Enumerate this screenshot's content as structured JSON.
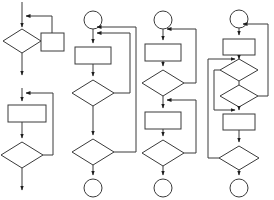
{
  "document": {
    "title": "Flowchart Diagram Sheet",
    "kind": "flowchart",
    "background_color": "#ffffff",
    "stroke_color": "#3a3a3a",
    "arrow_color": "#1d1d1d",
    "fill_color": "#ffffff",
    "width": 274,
    "height": 200,
    "description": "Four vertical control-flow flowchart columns drawn with rectangles (process), diamonds (decision), circles (terminator) and directed connector arrows with feedback loops."
  },
  "columns": [
    {
      "id": "column-1",
      "name": "flow-column-1",
      "label": "Column 1",
      "start_terminator": "none",
      "end_terminator": "arrow",
      "nodes": [
        {
          "id": "c1-d1",
          "type": "decision",
          "shape": "diamond",
          "label": "",
          "cx": 22,
          "cy": 41,
          "rx": 19,
          "ry": 12
        },
        {
          "id": "c1-p1",
          "type": "process",
          "shape": "rectangle",
          "label": "",
          "x": 41,
          "y": 33,
          "w": 23,
          "h": 18
        },
        {
          "id": "c1-p2",
          "type": "process",
          "shape": "rectangle",
          "label": "",
          "x": 8,
          "y": 105,
          "w": 38,
          "h": 17
        },
        {
          "id": "c1-d2",
          "type": "decision",
          "shape": "diamond",
          "label": "",
          "cx": 22,
          "cy": 155,
          "rx": 21,
          "ry": 13
        }
      ],
      "edges": [
        {
          "id": "c1-e1",
          "from": "top-entry",
          "to": "c1-d1",
          "kind": "straight"
        },
        {
          "id": "c1-e2",
          "from": "c1-d1",
          "to": "c1-p1",
          "kind": "straight"
        },
        {
          "id": "c1-e3",
          "from": "c1-p1",
          "to": "top-entry",
          "kind": "feedback-loop"
        },
        {
          "id": "c1-e4",
          "from": "c1-d1",
          "to": "exit-1",
          "kind": "straight"
        },
        {
          "id": "c1-e5",
          "from": "segment-entry-2",
          "to": "c1-p2",
          "kind": "straight"
        },
        {
          "id": "c1-e6",
          "from": "c1-p2",
          "to": "c1-d2",
          "kind": "straight"
        },
        {
          "id": "c1-e7",
          "from": "c1-d2",
          "to": "segment-entry-2",
          "kind": "feedback-loop"
        },
        {
          "id": "c1-e8",
          "from": "c1-d2",
          "to": "exit-2",
          "kind": "straight"
        }
      ]
    },
    {
      "id": "column-2",
      "name": "flow-column-2",
      "label": "Column 2",
      "start_terminator": "circle",
      "end_terminator": "circle",
      "nodes": [
        {
          "id": "c2-t1",
          "type": "terminator",
          "shape": "circle",
          "label": "",
          "cx": 93,
          "cy": 20,
          "r": 9
        },
        {
          "id": "c2-p1",
          "type": "process",
          "shape": "rectangle",
          "label": "",
          "x": 75,
          "y": 47,
          "w": 36,
          "h": 17
        },
        {
          "id": "c2-d1",
          "type": "decision",
          "shape": "diamond",
          "label": "",
          "cx": 93,
          "cy": 93,
          "rx": 21,
          "ry": 13
        },
        {
          "id": "c2-d2",
          "type": "decision",
          "shape": "diamond",
          "label": "",
          "cx": 93,
          "cy": 152,
          "rx": 21,
          "ry": 13
        },
        {
          "id": "c2-t2",
          "type": "terminator",
          "shape": "circle",
          "label": "",
          "cx": 93,
          "cy": 188,
          "r": 9
        }
      ],
      "edges": [
        {
          "id": "c2-e1",
          "from": "c2-t1",
          "to": "c2-p1",
          "kind": "straight"
        },
        {
          "id": "c2-e2",
          "from": "c2-p1",
          "to": "c2-d1",
          "kind": "straight"
        },
        {
          "id": "c2-e3",
          "from": "c2-d1",
          "to": "c2-p1-entry",
          "kind": "feedback-loop-inner"
        },
        {
          "id": "c2-e4",
          "from": "c2-d1",
          "to": "c2-d2",
          "kind": "straight"
        },
        {
          "id": "c2-e5",
          "from": "c2-d2",
          "to": "c2-t1-exit",
          "kind": "feedback-loop-outer"
        },
        {
          "id": "c2-e6",
          "from": "c2-d2",
          "to": "c2-t2",
          "kind": "straight"
        }
      ]
    },
    {
      "id": "column-3",
      "name": "flow-column-3",
      "label": "Column 3",
      "start_terminator": "circle",
      "end_terminator": "circle",
      "nodes": [
        {
          "id": "c3-t1",
          "type": "terminator",
          "shape": "circle",
          "label": "",
          "cx": 163,
          "cy": 20,
          "r": 9
        },
        {
          "id": "c3-p1",
          "type": "process",
          "shape": "rectangle",
          "label": "",
          "x": 145,
          "y": 44,
          "w": 36,
          "h": 17
        },
        {
          "id": "c3-d1",
          "type": "decision",
          "shape": "diamond",
          "label": "",
          "cx": 163,
          "cy": 83,
          "rx": 21,
          "ry": 13
        },
        {
          "id": "c3-p2",
          "type": "process",
          "shape": "rectangle",
          "label": "",
          "x": 145,
          "y": 112,
          "w": 36,
          "h": 17
        },
        {
          "id": "c3-d2",
          "type": "decision",
          "shape": "diamond",
          "label": "",
          "cx": 163,
          "cy": 153,
          "rx": 21,
          "ry": 13
        },
        {
          "id": "c3-t2",
          "type": "terminator",
          "shape": "circle",
          "label": "",
          "cx": 163,
          "cy": 188,
          "r": 9
        }
      ],
      "edges": [
        {
          "id": "c3-e1",
          "from": "c3-t1",
          "to": "c3-p1",
          "kind": "straight"
        },
        {
          "id": "c3-e2",
          "from": "c3-p1",
          "to": "c3-d1",
          "kind": "straight"
        },
        {
          "id": "c3-e3",
          "from": "c3-d1",
          "to": "c3-p1-entry",
          "kind": "feedback-loop"
        },
        {
          "id": "c3-e4",
          "from": "c3-d1",
          "to": "c3-p2-entry",
          "kind": "straight"
        },
        {
          "id": "c3-e5",
          "from": "c3-p2",
          "to": "c3-d2",
          "kind": "straight"
        },
        {
          "id": "c3-e6",
          "from": "c3-d2",
          "to": "c3-p2-entry",
          "kind": "feedback-loop"
        },
        {
          "id": "c3-e7",
          "from": "c3-d2",
          "to": "c3-t2",
          "kind": "straight"
        }
      ]
    },
    {
      "id": "column-4",
      "name": "flow-column-4",
      "label": "Column 4",
      "start_terminator": "circle",
      "end_terminator": "circle",
      "nodes": [
        {
          "id": "c4-t1",
          "type": "terminator",
          "shape": "circle",
          "label": "",
          "cx": 239,
          "cy": 19,
          "r": 9
        },
        {
          "id": "c4-p1",
          "type": "process",
          "shape": "rectangle",
          "label": "",
          "x": 223,
          "y": 39,
          "w": 32,
          "h": 16
        },
        {
          "id": "c4-d1",
          "type": "decision",
          "shape": "diamond",
          "label": "",
          "cx": 239,
          "cy": 70,
          "rx": 19,
          "ry": 11
        },
        {
          "id": "c4-d2",
          "type": "decision",
          "shape": "diamond",
          "label": "",
          "cx": 239,
          "cy": 96,
          "rx": 19,
          "ry": 11
        },
        {
          "id": "c4-p2",
          "type": "process",
          "shape": "rectangle",
          "label": "",
          "x": 223,
          "y": 114,
          "w": 32,
          "h": 16
        },
        {
          "id": "c4-d3",
          "type": "decision",
          "shape": "diamond",
          "label": "",
          "cx": 239,
          "cy": 158,
          "rx": 20,
          "ry": 12
        },
        {
          "id": "c4-t2",
          "type": "terminator",
          "shape": "circle",
          "label": "",
          "cx": 239,
          "cy": 188,
          "r": 9
        }
      ],
      "edges": [
        {
          "id": "c4-e1",
          "from": "c4-t1",
          "to": "c4-p1",
          "kind": "straight"
        },
        {
          "id": "c4-e2",
          "from": "c4-p1",
          "to": "c4-d1",
          "kind": "straight"
        },
        {
          "id": "c4-e3",
          "from": "c4-d1",
          "to": "c4-p2-entry",
          "kind": "bypass-left"
        },
        {
          "id": "c4-e4",
          "from": "c4-d1",
          "to": "c4-d2",
          "kind": "straight"
        },
        {
          "id": "c4-e5",
          "from": "c4-d2",
          "to": "c4-t1",
          "kind": "feedback-loop-right"
        },
        {
          "id": "c4-e6",
          "from": "c4-d2",
          "to": "c4-p2",
          "kind": "straight"
        },
        {
          "id": "c4-e7",
          "from": "c4-p2",
          "to": "c4-d3",
          "kind": "straight"
        },
        {
          "id": "c4-e8",
          "from": "c4-d3",
          "to": "c4-p1-exit",
          "kind": "feedback-loop-far-left"
        },
        {
          "id": "c4-e9",
          "from": "c4-d3",
          "to": "c4-t2",
          "kind": "straight"
        }
      ]
    }
  ],
  "legend": {
    "shapes": [
      {
        "shape": "circle",
        "meaning": "terminator"
      },
      {
        "shape": "rectangle",
        "meaning": "process"
      },
      {
        "shape": "diamond",
        "meaning": "decision"
      },
      {
        "shape": "arrow",
        "meaning": "control flow"
      }
    ]
  }
}
